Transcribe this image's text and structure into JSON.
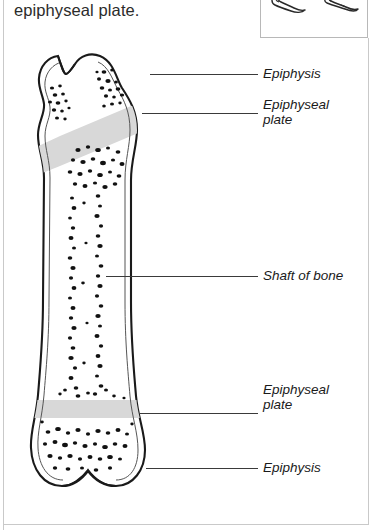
{
  "page": {
    "heading": "epiphyseal plate.",
    "background_color": "#ffffff",
    "border_color": "#c9c9c9"
  },
  "inset_box": {
    "name": "bone sketch inset",
    "figures": [
      {
        "icon": "bone-sketch-icon",
        "label": "bone sketch left"
      },
      {
        "icon": "bone-sketch-icon",
        "label": "bone sketch right"
      }
    ]
  },
  "figure": {
    "name": "long bone longitudinal section",
    "icon": "long-bone-diagram-icon",
    "colors": {
      "outline": "#1a1a1a",
      "epiphyseal_plate": "#d8d8d8",
      "marrow_speckle": "#111111",
      "cortex_fill": "#ffffff"
    }
  },
  "labels": [
    {
      "id": "epiphysis-top",
      "text": "Epiphysis"
    },
    {
      "id": "epiphyseal-plate-top",
      "text": "Epiphyseal\nplate"
    },
    {
      "id": "shaft-of-bone",
      "text": "Shaft of bone"
    },
    {
      "id": "epiphyseal-plate-bottom",
      "text": "Epiphyseal\nplate"
    },
    {
      "id": "epiphysis-bottom",
      "text": "Epiphysis"
    }
  ]
}
